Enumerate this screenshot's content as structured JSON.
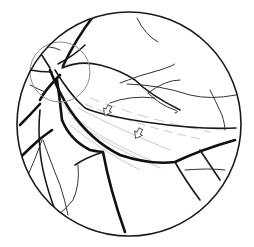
{
  "figure": {
    "type": "retinal fundus line drawing",
    "width": 254,
    "height": 247,
    "background": "#ffffff",
    "line_color": "#111111",
    "optic_disc_outline_color": "#8a8a8a",
    "hatching_color": "#bdbdbd",
    "annotations": [
      {
        "name": "arrow-1",
        "glyph": "hollow-arrow",
        "x": 107,
        "y": 111
      },
      {
        "name": "arrow-2",
        "glyph": "hollow-arrow",
        "x": 138,
        "y": 134
      }
    ]
  }
}
